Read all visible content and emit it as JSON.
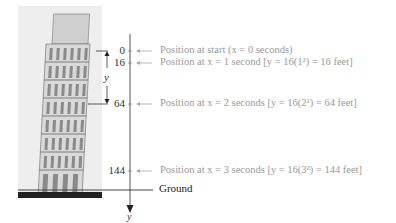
{
  "figure": {
    "tower_image": "leaning-tower-of-pisa-illustration",
    "axis_label": "y",
    "bracket_label": "y",
    "ground_label": "Ground",
    "ticks": [
      {
        "value": "0",
        "note": "Position at start (x = 0 seconds)"
      },
      {
        "value": "16",
        "note": "Position at x = 1 second [y = 16(1²) = 16 feet]"
      },
      {
        "value": "64",
        "note": "Position at x = 2 seconds [y = 16(2²) = 64 feet]"
      },
      {
        "value": "144",
        "note": "Position at x = 3 seconds [y = 16(3²) = 144 feet]"
      }
    ],
    "colors": {
      "axis": "#555555",
      "note_text": "#9a9a9a",
      "tick_text": "#333333"
    }
  }
}
